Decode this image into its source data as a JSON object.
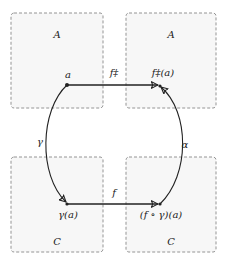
{
  "diagram": {
    "boxes": [
      {
        "id": "top-left",
        "label": "A",
        "x": 11,
        "y": 13,
        "w": 92,
        "h": 95
      },
      {
        "id": "top-right",
        "label": "A",
        "x": 126,
        "y": 13,
        "w": 90,
        "h": 95
      },
      {
        "id": "bottom-left",
        "label": "C",
        "x": 11,
        "y": 157,
        "w": 92,
        "h": 95
      },
      {
        "id": "bottom-right",
        "label": "C",
        "x": 126,
        "y": 157,
        "w": 90,
        "h": 95
      }
    ],
    "nodes": {
      "a": {
        "label": "a",
        "x": 67,
        "y": 85
      },
      "f_dagger_a": {
        "label": "f‡(a)",
        "x": 160,
        "y": 86
      },
      "gamma_a": {
        "label": "γ(a)",
        "x": 67,
        "y": 204
      },
      "f_gamma_a": {
        "label": "(f ∘ γ)(a)",
        "x": 160,
        "y": 204
      }
    },
    "arrows": {
      "f_dagger": {
        "label": "f‡",
        "from": "a",
        "to": "f‡(a)"
      },
      "f": {
        "label": "f",
        "from": "γ(a)",
        "to": "(f ∘ γ)(a)"
      },
      "gamma": {
        "label": "γ",
        "from": "a",
        "to": "γ(a)"
      },
      "alpha": {
        "label": "α",
        "from": "(f ∘ γ)(a)",
        "to": "f‡(a)"
      }
    },
    "colors": {
      "box_border": "#888888",
      "box_fill": "#f7f7f7",
      "arrow": "#222222",
      "text": "#222222"
    }
  }
}
